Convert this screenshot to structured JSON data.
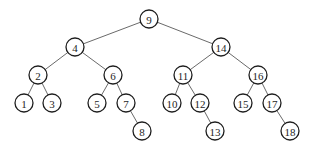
{
  "diagram": {
    "type": "binary-search-tree",
    "style": {
      "edge_color": "#6a6a6a",
      "node_stroke": "#1e1e1e",
      "node_fill": "#ffffff",
      "background": "#ffffff",
      "node_radius": 9
    },
    "nodes": [
      {
        "id": "n9",
        "label": "9",
        "x": 149,
        "y": 19
      },
      {
        "id": "n4",
        "label": "4",
        "x": 75,
        "y": 47
      },
      {
        "id": "n14",
        "label": "14",
        "x": 221,
        "y": 47
      },
      {
        "id": "n2",
        "label": "2",
        "x": 38,
        "y": 75
      },
      {
        "id": "n6",
        "label": "6",
        "x": 113,
        "y": 75
      },
      {
        "id": "n11",
        "label": "11",
        "x": 183,
        "y": 75
      },
      {
        "id": "n16",
        "label": "16",
        "x": 258,
        "y": 75
      },
      {
        "id": "n1",
        "label": "1",
        "x": 24,
        "y": 103
      },
      {
        "id": "n3",
        "label": "3",
        "x": 52,
        "y": 103
      },
      {
        "id": "n5",
        "label": "5",
        "x": 97,
        "y": 103
      },
      {
        "id": "n7",
        "label": "7",
        "x": 126,
        "y": 103
      },
      {
        "id": "n10",
        "label": "10",
        "x": 172,
        "y": 103
      },
      {
        "id": "n12",
        "label": "12",
        "x": 200,
        "y": 103
      },
      {
        "id": "n15",
        "label": "15",
        "x": 243,
        "y": 103
      },
      {
        "id": "n17",
        "label": "17",
        "x": 272,
        "y": 103
      },
      {
        "id": "n8",
        "label": "8",
        "x": 142,
        "y": 131
      },
      {
        "id": "n13",
        "label": "13",
        "x": 215,
        "y": 131
      },
      {
        "id": "n18",
        "label": "18",
        "x": 290,
        "y": 131
      }
    ],
    "edges": [
      {
        "from": "n9",
        "to": "n4"
      },
      {
        "from": "n9",
        "to": "n14"
      },
      {
        "from": "n4",
        "to": "n2"
      },
      {
        "from": "n4",
        "to": "n6"
      },
      {
        "from": "n14",
        "to": "n11"
      },
      {
        "from": "n14",
        "to": "n16"
      },
      {
        "from": "n2",
        "to": "n1"
      },
      {
        "from": "n2",
        "to": "n3"
      },
      {
        "from": "n6",
        "to": "n5"
      },
      {
        "from": "n6",
        "to": "n7"
      },
      {
        "from": "n7",
        "to": "n8"
      },
      {
        "from": "n11",
        "to": "n10"
      },
      {
        "from": "n11",
        "to": "n12"
      },
      {
        "from": "n12",
        "to": "n13"
      },
      {
        "from": "n16",
        "to": "n15"
      },
      {
        "from": "n16",
        "to": "n17"
      },
      {
        "from": "n17",
        "to": "n18"
      }
    ]
  }
}
